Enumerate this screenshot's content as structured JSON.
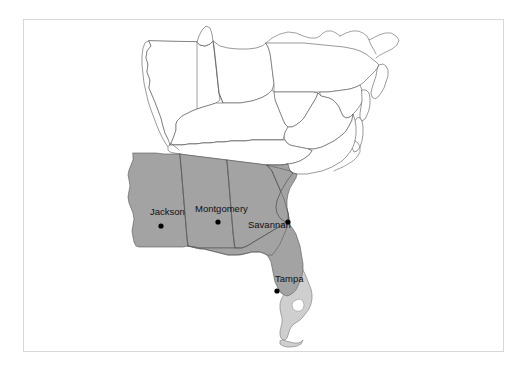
{
  "figure": {
    "type": "map",
    "title": "",
    "background_color": "#ffffff",
    "frame_color": "#d8d8d8",
    "region_description": "Southeastern United States"
  },
  "map": {
    "shaded_fill": "#a3a3a3",
    "light_shaded_fill": "#cfcfcf",
    "unshaded_fill": "#ffffff",
    "outline_color": "#555555",
    "shaded_states": [
      "Mississippi",
      "Alabama",
      "Georgia",
      "South Carolina",
      "Florida"
    ],
    "unshaded_states": [
      "Illinois",
      "Indiana",
      "Ohio",
      "Kentucky",
      "Tennessee",
      "North Carolina",
      "Virginia",
      "West Virginia",
      "Pennsylvania",
      "New Jersey",
      "Maryland",
      "Delaware",
      "Michigan",
      "New York",
      "Louisiana",
      "Arkansas",
      "Missouri"
    ],
    "lakes": [
      "Lake Okeechobee"
    ]
  },
  "cities": [
    {
      "name": "Jackson",
      "label_x": 150,
      "label_y": 215,
      "dot_x": 161,
      "dot_y": 226
    },
    {
      "name": "Montgomery",
      "label_x": 195,
      "label_y": 212,
      "dot_x": 218,
      "dot_y": 222
    },
    {
      "name": "Savannah",
      "label_x": 248,
      "label_y": 228,
      "dot_x": 288,
      "dot_y": 222
    },
    {
      "name": "Tampa",
      "label_x": 275,
      "label_y": 282,
      "dot_x": 277,
      "dot_y": 291
    }
  ],
  "city_labels": {
    "jackson": "Jackson",
    "montgomery": "Montgomery",
    "savannah": "Savannah",
    "tampa": "Tampa"
  }
}
